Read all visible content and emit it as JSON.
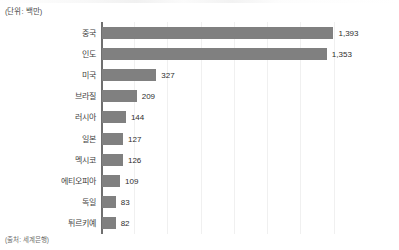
{
  "unit_label": "(단위: 백만)",
  "source_note": "(출처: 세계은행)",
  "accent_color": "#808080",
  "axis_color": "#6f6f6f",
  "grid_color": "#f0f0f0",
  "chart_data": {
    "type": "bar",
    "orientation": "horizontal",
    "title": "",
    "subtitle": "",
    "xlabel": "",
    "ylabel": "",
    "unit": "백만",
    "source": "세계은행",
    "grid": true,
    "legend": false,
    "xlim": [
      0,
      1500
    ],
    "gridline_values": [
      0,
      200,
      400,
      600,
      800,
      1000,
      1200,
      1400
    ],
    "categories": [
      "중국",
      "인도",
      "미국",
      "브라질",
      "러시아",
      "일본",
      "멕시코",
      "에티오피아",
      "독일",
      "튀르키예"
    ],
    "values": [
      1393,
      1353,
      327,
      209,
      144,
      127,
      126,
      109,
      83,
      82
    ],
    "value_labels": [
      "1,393",
      "1,353",
      "327",
      "209",
      "144",
      "127",
      "126",
      "109",
      "83",
      "82"
    ]
  }
}
